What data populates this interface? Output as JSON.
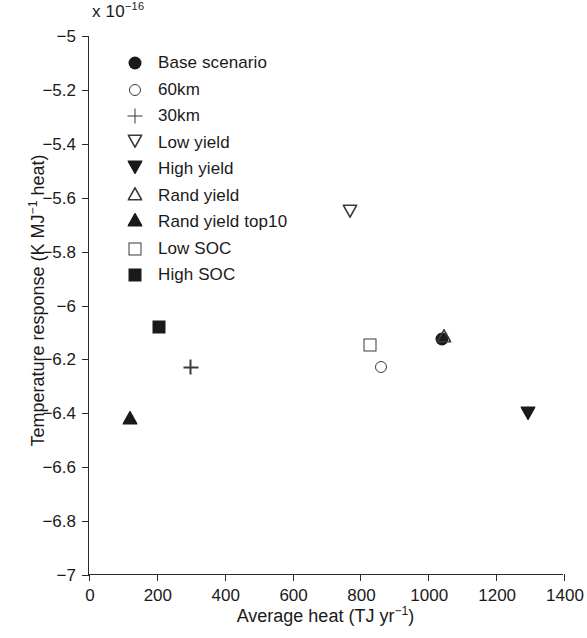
{
  "chart_data": {
    "type": "scatter",
    "title": "",
    "xlabel": "Average heat (TJ yr−1)",
    "ylabel": "Temperature response (K MJ−1 heat)",
    "y_multiplier": "x 10",
    "y_multiplier_exp": "−16",
    "xlim": [
      0,
      1400
    ],
    "ylim": [
      -7,
      -5
    ],
    "xticks": [
      0,
      200,
      400,
      600,
      800,
      1000,
      1200,
      1400
    ],
    "xtick_labels": [
      "0",
      "200",
      "400",
      "600",
      "800",
      "1000",
      "1200",
      "1400"
    ],
    "yticks": [
      -5,
      -5.2,
      -5.4,
      -5.6,
      -5.8,
      -6,
      -6.2,
      -6.4,
      -6.6,
      -6.8,
      -7
    ],
    "ytick_labels": [
      "−5",
      "−5.2",
      "−5.4",
      "−5.6",
      "−5.8",
      "−6",
      "−6.2",
      "−6.4",
      "−6.6",
      "−6.8",
      "−7"
    ],
    "grid": false,
    "legend_position": "upper left",
    "series": [
      {
        "name": "Base scenario",
        "marker": "filled-circle",
        "x": [
          1040
        ],
        "y": [
          -6.125
        ]
      },
      {
        "name": "60km",
        "marker": "open-circle",
        "x": [
          862
        ],
        "y": [
          -6.23
        ]
      },
      {
        "name": "30km",
        "marker": "plus",
        "x": [
          300
        ],
        "y": [
          -6.23
        ]
      },
      {
        "name": "Low yield",
        "marker": "open-down-triangle",
        "x": [
          770
        ],
        "y": [
          -5.655
        ]
      },
      {
        "name": "High yield",
        "marker": "filled-down-triangle",
        "x": [
          1295
        ],
        "y": [
          -6.405
        ]
      },
      {
        "name": "Rand yield",
        "marker": "open-up-triangle",
        "x": [
          1045
        ],
        "y": [
          -6.12
        ]
      },
      {
        "name": "Rand yield top10",
        "marker": "filled-up-triangle",
        "x": [
          120
        ],
        "y": [
          -6.425
        ]
      },
      {
        "name": "Low SOC",
        "marker": "open-square",
        "x": [
          827
        ],
        "y": [
          -6.145
        ]
      },
      {
        "name": "High SOC",
        "marker": "filled-square",
        "x": [
          205
        ],
        "y": [
          -6.08
        ]
      }
    ]
  },
  "colors": {
    "axis": "#2b2b2b",
    "marker_filled": "#1a1a1a",
    "marker_open": "#3a3a3a",
    "background": "#ffffff"
  }
}
